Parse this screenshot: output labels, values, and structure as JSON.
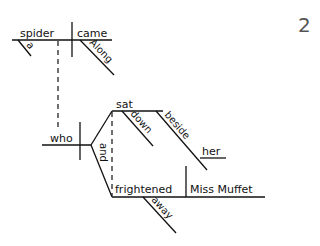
{
  "page_number_fragment": "2",
  "diagram": {
    "type": "reed-kellogg-sentence-diagram",
    "main_clause": {
      "subject": "spider",
      "subject_modifier": "a",
      "verb": "came",
      "verb_modifier": "Along"
    },
    "relative_clause": {
      "subject": "who",
      "conjunction": "and",
      "compound_verbs": [
        {
          "verb": "sat",
          "modifiers": [
            "down"
          ],
          "prepositional_phrase": {
            "preposition": "beside",
            "object": "her"
          }
        },
        {
          "verb": "frightened",
          "direct_object": "Miss Muffet",
          "modifiers": [
            "away"
          ]
        }
      ]
    }
  }
}
